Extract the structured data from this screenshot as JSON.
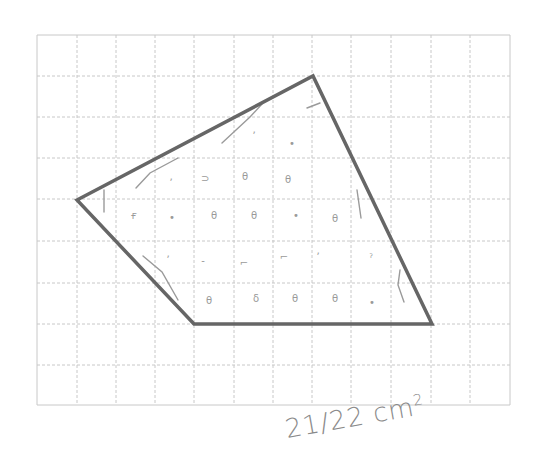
{
  "worksheet": {
    "grid": {
      "x_lines": [
        37,
        77,
        116,
        155,
        194,
        234,
        273,
        312,
        351,
        391,
        431,
        470,
        510
      ],
      "y_lines": [
        35,
        76,
        117,
        158,
        199,
        241,
        283,
        324,
        365,
        405
      ],
      "line_color": "#c8c8c8",
      "columns": 12,
      "rows": 9
    },
    "shape": {
      "type": "quadrilateral",
      "vertices": [
        [
          77,
          200
        ],
        [
          313,
          76
        ],
        [
          432,
          324
        ],
        [
          194,
          324
        ]
      ],
      "stroke_color": "#666666",
      "stroke_width": 3.5
    },
    "pencil_marks": {
      "color": "#9a9a9a",
      "strokes": [
        [
          [
            104,
            190
          ],
          [
            104,
            212
          ]
        ],
        [
          [
            136,
            188
          ],
          [
            150,
            173
          ],
          [
            178,
            158
          ]
        ],
        [
          [
            222,
            143
          ],
          [
            250,
            117
          ],
          [
            262,
            104
          ]
        ],
        [
          [
            307,
            108
          ],
          [
            320,
            103
          ]
        ],
        [
          [
            357,
            190
          ],
          [
            361,
            218
          ]
        ],
        [
          [
            400,
            270
          ],
          [
            398,
            285
          ],
          [
            404,
            302
          ]
        ],
        [
          [
            143,
            256
          ],
          [
            162,
            272
          ],
          [
            178,
            300
          ]
        ]
      ],
      "dots": [
        {
          "x": 171,
          "y": 186,
          "g": "ʼ"
        },
        {
          "x": 205,
          "y": 182,
          "g": "⊃"
        },
        {
          "x": 245,
          "y": 180,
          "g": "θ"
        },
        {
          "x": 288,
          "y": 183,
          "g": "θ"
        },
        {
          "x": 254,
          "y": 139,
          "g": "ʼ"
        },
        {
          "x": 292,
          "y": 147,
          "g": "•"
        },
        {
          "x": 134,
          "y": 219,
          "g": "ғ"
        },
        {
          "x": 172,
          "y": 221,
          "g": "•"
        },
        {
          "x": 214,
          "y": 219,
          "g": "θ"
        },
        {
          "x": 254,
          "y": 219,
          "g": "θ"
        },
        {
          "x": 296,
          "y": 219,
          "g": "•"
        },
        {
          "x": 335,
          "y": 222,
          "g": "θ"
        },
        {
          "x": 168,
          "y": 263,
          "g": "ʼ"
        },
        {
          "x": 203,
          "y": 264,
          "g": "‐"
        },
        {
          "x": 244,
          "y": 266,
          "g": "⌐"
        },
        {
          "x": 284,
          "y": 260,
          "g": "⌐"
        },
        {
          "x": 318,
          "y": 260,
          "g": "ʼ"
        },
        {
          "x": 371,
          "y": 262,
          "g": "ˀ"
        },
        {
          "x": 209,
          "y": 304,
          "g": "θ"
        },
        {
          "x": 256,
          "y": 302,
          "g": "δ"
        },
        {
          "x": 295,
          "y": 302,
          "g": "θ"
        },
        {
          "x": 335,
          "y": 302,
          "g": "θ"
        },
        {
          "x": 372,
          "y": 306,
          "g": "•"
        }
      ]
    },
    "answer": {
      "text": "21/22 cm",
      "superscript": "2"
    }
  }
}
